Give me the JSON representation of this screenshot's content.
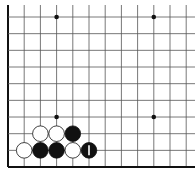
{
  "diagram": {
    "type": "go-board-fragment",
    "origin_x": 8,
    "origin_y": 17,
    "spacing_x": 16.2,
    "spacing_y": 16.67,
    "cols": 12,
    "rows": 10,
    "colors": {
      "line": "#555555",
      "edge": "#111111",
      "black": "#111111",
      "white": "#ffffff",
      "background": "#ffffff"
    },
    "star_points": [
      [
        3,
        0
      ],
      [
        9,
        0
      ],
      [
        3,
        6
      ],
      [
        9,
        6
      ]
    ],
    "stones": [
      {
        "col": 2,
        "row": 7,
        "color": "white",
        "label": ""
      },
      {
        "col": 3,
        "row": 7,
        "color": "white",
        "label": ""
      },
      {
        "col": 4,
        "row": 7,
        "color": "black",
        "label": ""
      },
      {
        "col": 1,
        "row": 8,
        "color": "white",
        "label": ""
      },
      {
        "col": 2,
        "row": 8,
        "color": "black",
        "label": ""
      },
      {
        "col": 3,
        "row": 8,
        "color": "black",
        "label": ""
      },
      {
        "col": 4,
        "row": 8,
        "color": "white",
        "label": ""
      },
      {
        "col": 5,
        "row": 8,
        "color": "black",
        "label": "1"
      }
    ]
  }
}
